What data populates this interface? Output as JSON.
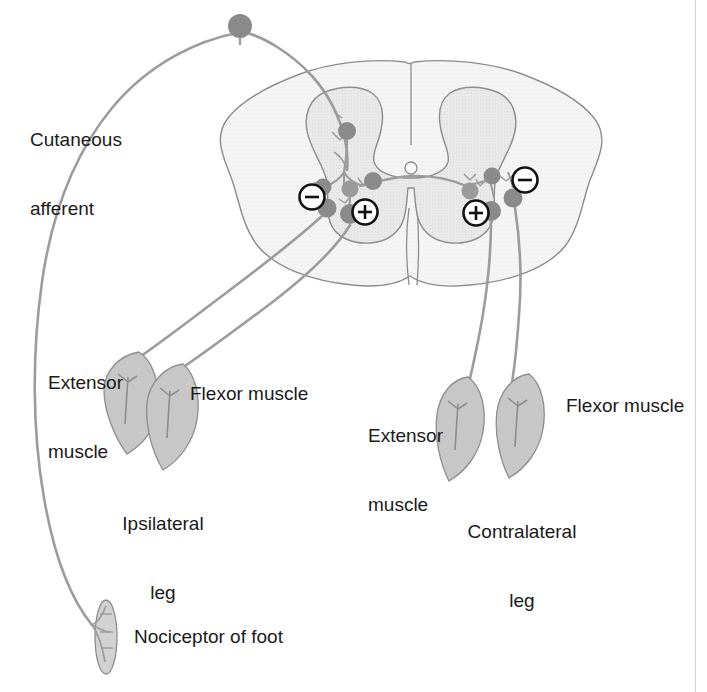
{
  "figure": {
    "background_color": "#ffffff",
    "colors": {
      "outline": "#8a8a8a",
      "gray_matter_fill": "#e8e8e8",
      "white_matter_fill": "#f2f2f2",
      "neuron_body": "#8c8c8c",
      "neuron_body_dark": "#7a7a7a",
      "axon": "#9a9a9a",
      "muscle_fill": "#c9c9c9",
      "text": "#1a1a1a",
      "sign_stroke": "#111111",
      "border_rule": "#d4d4d4"
    }
  },
  "labels": {
    "cutaneous_afferent": "Cutaneous\nafferent",
    "cutaneous_afferent_line1": "Cutaneous",
    "cutaneous_afferent_line2": "afferent",
    "ipsi_extensor_line1": "Extensor",
    "ipsi_extensor_line2": "muscle",
    "ipsi_flexor": "Flexor muscle",
    "ipsi_leg_line1": "Ipsilateral",
    "ipsi_leg_line2": "leg",
    "contra_extensor_line1": "Extensor",
    "contra_extensor_line2": "muscle",
    "contra_flexor": "Flexor muscle",
    "contra_leg_line1": "Contralateral",
    "contra_leg_line2": "leg",
    "nociceptor": "Nociceptor of foot"
  },
  "signs": {
    "ipsi_inhibitory": "−",
    "ipsi_excitatory": "+",
    "contra_inhibitory": "−",
    "contra_excitatory": "+"
  },
  "anatomy": {
    "dorsal_root_ganglion": "dorsal-root-ganglion-cell-body",
    "central_canal": "central-canal",
    "gray_matter": "spinal-gray-matter-butterfly",
    "white_matter": "spinal-white-matter",
    "midline": "dorsal-median-sulcus",
    "ventral_fissure": "ventral-median-fissure"
  },
  "neurons": {
    "ipsi_dorsal_interneuron": "dorsal-horn-interneuron",
    "ipsi_interneuron_a": "ipsilateral-interneuron-a",
    "ipsi_interneuron_b": "ipsilateral-interneuron-b",
    "ipsi_extensor_motor_neuron": "ipsilateral-extensor-motor-neuron",
    "ipsi_flexor_motor_neuron": "ipsilateral-flexor-motor-neuron",
    "commissural_neuron": "commissural-interneuron",
    "contra_interneuron_a": "contralateral-interneuron-a",
    "contra_interneuron_b": "contralateral-interneuron-b",
    "contra_extensor_motor_neuron": "contralateral-extensor-motor-neuron",
    "contra_flexor_motor_neuron": "contralateral-flexor-motor-neuron"
  }
}
